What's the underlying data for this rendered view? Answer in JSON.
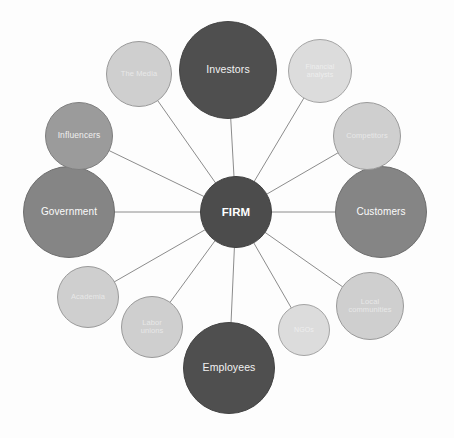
{
  "diagram": {
    "type": "hub-and-spoke",
    "background_color": "#fdfdfd",
    "edge_color": "#8c8c8c"
  },
  "hub": {
    "id": "firm",
    "label": "FIRM",
    "cx": 236,
    "cy": 212,
    "r": 36,
    "tier": "tier-hub",
    "color": "#4c4c4c"
  },
  "nodes": [
    {
      "id": "investors",
      "label": "Investors",
      "cx": 228,
      "cy": 70,
      "r": 49,
      "tier": "tier-dark",
      "color": "#4f4f4f"
    },
    {
      "id": "employees",
      "label": "Employees",
      "cx": 229,
      "cy": 368,
      "r": 46,
      "tier": "tier-dark",
      "color": "#4f4f4f"
    },
    {
      "id": "customers",
      "label": "Customers",
      "cx": 381,
      "cy": 212,
      "r": 46,
      "tier": "tier-mid",
      "color": "#858585"
    },
    {
      "id": "government",
      "label": "Government",
      "cx": 69,
      "cy": 212,
      "r": 46,
      "tier": "tier-mid",
      "color": "#858585"
    },
    {
      "id": "influencers",
      "label": "Influencers",
      "cx": 79,
      "cy": 136,
      "r": 34,
      "tier": "tier-midlight",
      "color": "#9b9b9b"
    },
    {
      "id": "the-media",
      "label": "The Media",
      "cx": 139,
      "cy": 74,
      "r": 33,
      "tier": "tier-light",
      "color": "#cfcfcf"
    },
    {
      "id": "financial-analysts",
      "label": "Financial\nanalysts",
      "cx": 320,
      "cy": 71,
      "r": 32,
      "tier": "tier-lighter",
      "color": "#dcdcdc"
    },
    {
      "id": "competitors",
      "label": "Competitors",
      "cx": 367,
      "cy": 136,
      "r": 34,
      "tier": "tier-light",
      "color": "#cfcfcf"
    },
    {
      "id": "local-communities",
      "label": "Local\ncommunities",
      "cx": 370,
      "cy": 306,
      "r": 34,
      "tier": "tier-light",
      "color": "#cfcfcf"
    },
    {
      "id": "academia",
      "label": "Academia",
      "cx": 88,
      "cy": 297,
      "r": 31,
      "tier": "tier-light",
      "color": "#cfcfcf"
    },
    {
      "id": "labor-unions",
      "label": "Labor\nunions",
      "cx": 152,
      "cy": 327,
      "r": 31,
      "tier": "tier-light",
      "color": "#cfcfcf"
    },
    {
      "id": "ngos",
      "label": "NGOs",
      "cx": 304,
      "cy": 330,
      "r": 26,
      "tier": "tier-lighter",
      "color": "#dcdcdc"
    }
  ],
  "edges": [
    {
      "from": "firm",
      "to": "investors"
    },
    {
      "from": "firm",
      "to": "employees"
    },
    {
      "from": "firm",
      "to": "customers"
    },
    {
      "from": "firm",
      "to": "government"
    },
    {
      "from": "firm",
      "to": "influencers"
    },
    {
      "from": "firm",
      "to": "the-media"
    },
    {
      "from": "firm",
      "to": "financial-analysts"
    },
    {
      "from": "firm",
      "to": "competitors"
    },
    {
      "from": "firm",
      "to": "local-communities"
    },
    {
      "from": "firm",
      "to": "academia"
    },
    {
      "from": "firm",
      "to": "labor-unions"
    },
    {
      "from": "firm",
      "to": "ngos"
    }
  ]
}
